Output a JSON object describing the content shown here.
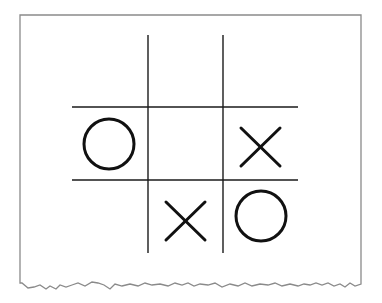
{
  "diagram": {
    "type": "tic-tac-toe-board",
    "colors": {
      "background": "#ffffff",
      "paper_border": "#8a8a8a",
      "grid": "#1a1a1a",
      "marks": "#111111"
    },
    "grid": {
      "rows": 3,
      "cols": 3
    },
    "board": [
      [
        "",
        "",
        ""
      ],
      [
        "O",
        "",
        "X"
      ],
      [
        "",
        "X",
        "O"
      ]
    ],
    "marks": [
      {
        "symbol": "O",
        "row": 1,
        "col": 0
      },
      {
        "symbol": "X",
        "row": 1,
        "col": 2
      },
      {
        "symbol": "X",
        "row": 2,
        "col": 1
      },
      {
        "symbol": "O",
        "row": 2,
        "col": 2
      }
    ]
  }
}
